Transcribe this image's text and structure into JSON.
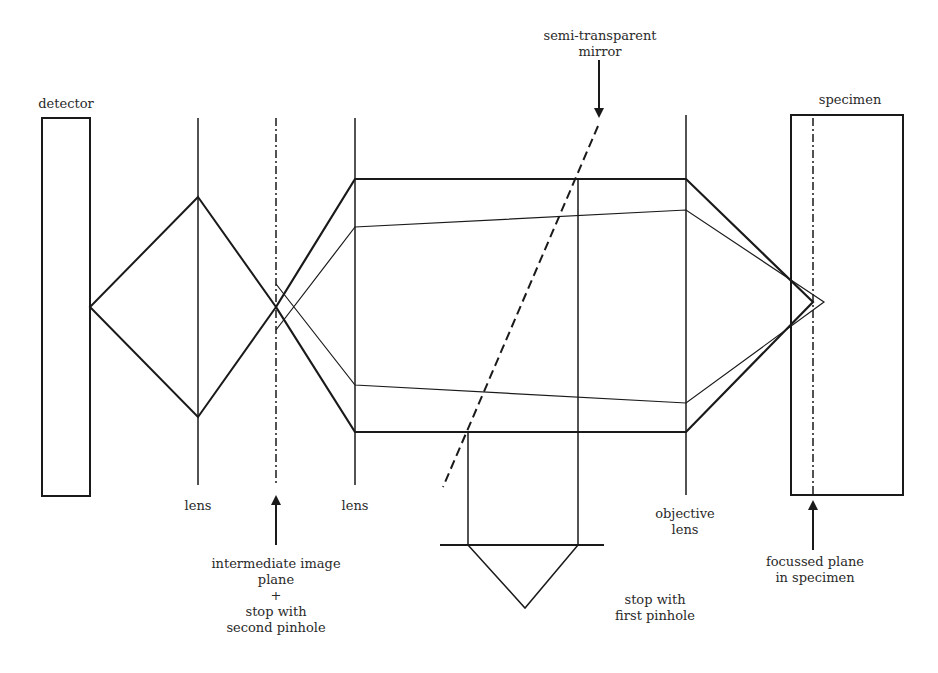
{
  "diagram": {
    "labels": {
      "detector": "detector",
      "specimen": "specimen",
      "mirror": "semi-transparent\nmirror",
      "lens1": "lens",
      "lens2": "lens",
      "objective": "objective\nlens",
      "intermediate": "intermediate image\nplane\n+\nstop with\nsecond pinhole",
      "first_pinhole": "stop with\nfirst pinhole",
      "focussed_plane": "focussed plane\nin specimen"
    },
    "colors": {
      "line": "#1a1a1a",
      "text": "#2a2a2a",
      "background": "#ffffff"
    }
  }
}
